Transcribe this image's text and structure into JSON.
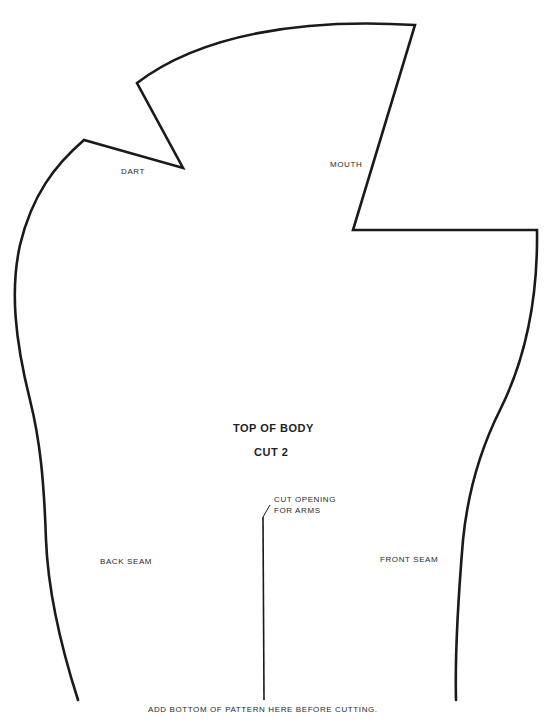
{
  "pattern": {
    "title": "TOP OF BODY",
    "subtitle": "CUT 2",
    "labels": {
      "dart": "DART",
      "mouth": "MOUTH",
      "back_seam": "BACK SEAM",
      "front_seam": "FRONT SEAM",
      "arm_opening_line1": "CUT OPENING",
      "arm_opening_line2": "FOR ARMS",
      "footer": "ADD BOTTOM OF PATTERN HERE BEFORE CUTTING."
    },
    "colors": {
      "outline": "#1a1a1a",
      "text": "#2a2a2a",
      "background": "#ffffff"
    }
  }
}
